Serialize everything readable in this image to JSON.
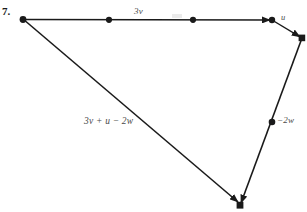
{
  "figure": {
    "item_number": "7.",
    "background_color": "#ffffff",
    "stroke_color": "#1a1a1a",
    "label_color": "#4a4a4a",
    "width": 307,
    "height": 212
  },
  "labels": {
    "top_vector": "3v",
    "short_vector": "u",
    "right_vector": "−2w",
    "resultant_vector": "3v + u − 2w"
  },
  "diagram_data": {
    "type": "vector-diagram",
    "description": "Head-to-tail vector addition polygon showing 3v + u − 2w",
    "vertices": [
      {
        "name": "origin",
        "x": 23,
        "y": 19
      },
      {
        "name": "top-right-node",
        "x": 272,
        "y": 20
      },
      {
        "name": "right-node",
        "x": 302,
        "y": 38
      },
      {
        "name": "bottom-node",
        "x": 240,
        "y": 205
      }
    ],
    "edges": [
      {
        "name": "3v",
        "label": "3v",
        "from": [
          23,
          19
        ],
        "to": [
          272,
          20
        ],
        "arrow": true,
        "tick_dots": [
          [
            109,
            20
          ],
          [
            193,
            20
          ]
        ]
      },
      {
        "name": "u",
        "label": "u",
        "from": [
          272,
          20
        ],
        "to": [
          302,
          38
        ],
        "arrow": true,
        "tick_dots": []
      },
      {
        "name": "-2w",
        "label": "−2w",
        "from": [
          302,
          38
        ],
        "to": [
          240,
          205
        ],
        "arrow": true,
        "tick_dots": [
          [
            272,
            122
          ]
        ]
      },
      {
        "name": "resultant",
        "label": "3v + u − 2w",
        "from": [
          23,
          19
        ],
        "to": [
          240,
          204
        ],
        "arrow": true,
        "tick_dots": []
      }
    ]
  }
}
